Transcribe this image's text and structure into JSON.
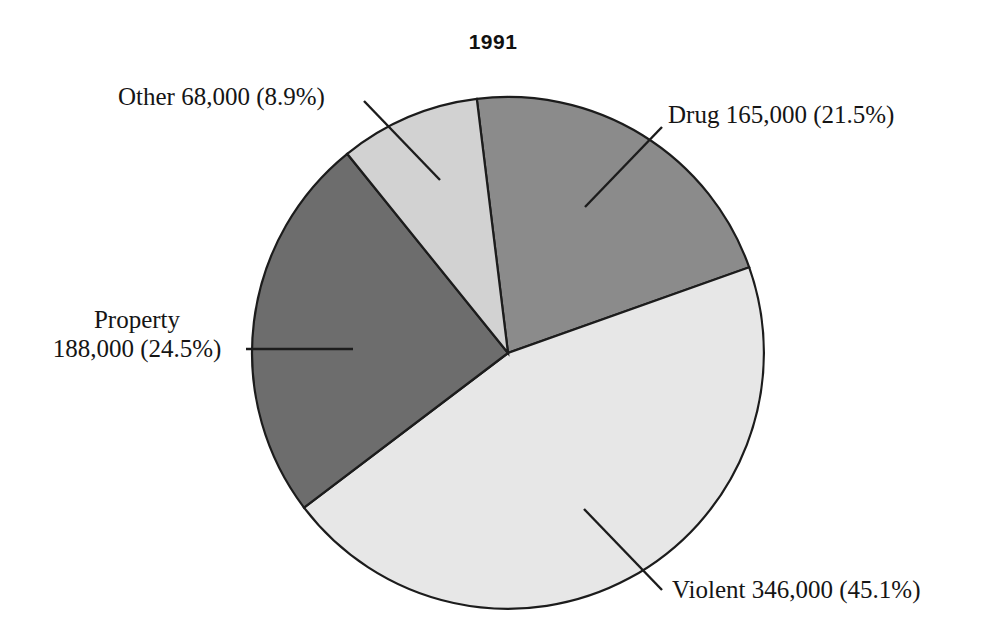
{
  "chart_data": {
    "type": "pie",
    "title": "1991",
    "xlabel": "",
    "ylabel": "",
    "legend_position": "callout-labels",
    "grid": false,
    "categories": [
      "Drug",
      "Violent",
      "Property",
      "Other"
    ],
    "values": [
      165000,
      346000,
      188000,
      68000
    ],
    "percentages": [
      21.5,
      45.1,
      24.5,
      8.9
    ],
    "slice_colors": [
      "#8b8b8b",
      "#e7e7e7",
      "#6d6d6d",
      "#d2d2d2"
    ],
    "start_angle_deg": -7,
    "direction": "clockwise",
    "annotations": [
      "Drug 165,000 (21.5%)",
      "Violent 346,000 (45.1%)",
      "Property 188,000 (24.5%)",
      "Other 68,000 (8.9%)"
    ]
  },
  "chart": {
    "title": "1991",
    "outline_color": "#1c1c1c",
    "background": "#ffffff"
  },
  "labels": {
    "other": {
      "text": "Other 68,000 (8.9%)",
      "name": "Other",
      "value": "68,000",
      "percent": "8.9%"
    },
    "drug": {
      "text": "Drug 165,000 (21.5%)",
      "name": "Drug",
      "value": "165,000",
      "percent": "21.5%"
    },
    "property": {
      "line1": "Property",
      "line2": "188,000 (24.5%)",
      "name": "Property",
      "value": "188,000",
      "percent": "24.5%"
    },
    "violent": {
      "text": "Violent 346,000 (45.1%)",
      "name": "Violent",
      "value": "346,000",
      "percent": "45.1%"
    }
  }
}
